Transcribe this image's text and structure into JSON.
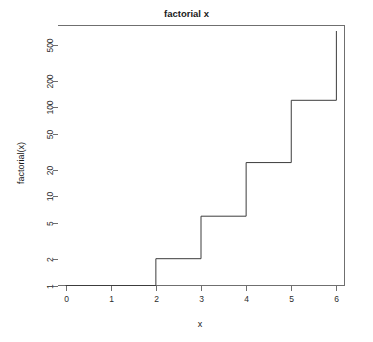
{
  "chart_data": {
    "type": "line",
    "title": "factorial x",
    "xlabel": "x",
    "ylabel": "factorial(x)",
    "line_style": "step",
    "step_direction": "post",
    "grid": false,
    "legend": "none",
    "yscale": "log",
    "xscale": "linear",
    "xlim": [
      -0.18,
      6.18
    ],
    "ylim": [
      1,
      830
    ],
    "x": [
      0,
      1,
      2,
      3,
      4,
      5,
      6
    ],
    "values": [
      1,
      1,
      2,
      6,
      24,
      120,
      720
    ],
    "series": [
      {
        "name": "factorial(x)",
        "values": [
          1,
          1,
          2,
          6,
          24,
          120,
          720
        ],
        "color": "#3c3c3c"
      }
    ],
    "xticks": [
      0,
      1,
      2,
      3,
      4,
      5,
      6
    ],
    "xtick_labels": [
      "0",
      "1",
      "2",
      "3",
      "4",
      "5",
      "6"
    ],
    "yticks": [
      1,
      2,
      5,
      10,
      20,
      50,
      100,
      200,
      500
    ],
    "ytick_labels": [
      "1",
      "2",
      "5",
      "10",
      "20",
      "50",
      "100",
      "200",
      "500"
    ],
    "colors": {
      "line": "#3c3c3c",
      "axis": "#6f6f6f",
      "text": "#1a1a1a",
      "background": "#ffffff"
    }
  }
}
